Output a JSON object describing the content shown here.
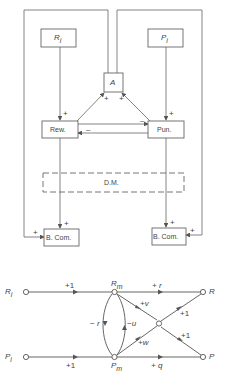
{
  "block_diagram": {
    "boxes": {
      "ri": "R",
      "ri_sub": "i",
      "pi": "P",
      "pi_sub": "i",
      "a": "A",
      "rew": "Rew.",
      "pun": "Pun.",
      "dm": "D.M.",
      "bcom_left": "B. Com.",
      "bcom_right": "B. Com."
    },
    "signs": {
      "ri_to_rew": "+",
      "pi_to_pun": "+",
      "rew_to_a": "+",
      "pun_to_a": "+",
      "rew_to_pun": "–",
      "pun_to_rew": "–",
      "rew_to_bcom": "+",
      "pun_to_bcom": "+",
      "a_to_bcom_left": "+",
      "a_to_bcom_right": "+"
    }
  },
  "signal_flow_graph": {
    "nodes": {
      "ri": "R",
      "ri_sub": "i",
      "pi": "P",
      "pi_sub": "i",
      "rm": "R",
      "rm_sub": "m",
      "pm": "P",
      "pm_sub": "m",
      "r": "R",
      "p": "P"
    },
    "gains": {
      "ri_rm": "+1",
      "pi_pm": "+1",
      "rm_r": "+ r",
      "pm_p": "+ q",
      "rm_center": "+v",
      "pm_center": "+w",
      "center_r": "+1",
      "center_p": "+1",
      "rm_pm": "− r",
      "pm_rm": "−u"
    }
  }
}
